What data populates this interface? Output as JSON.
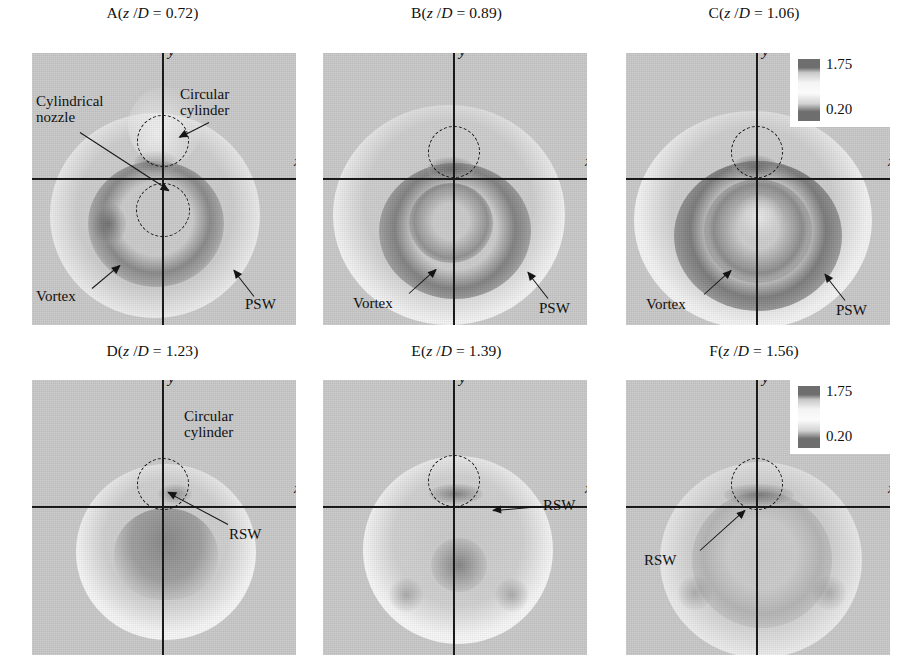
{
  "figure": {
    "kind": "shadowgraph-flow-visualization-grid",
    "rows": 2,
    "cols": 3,
    "background_color": "#ffffff",
    "field_background_color": "#c9c9c9"
  },
  "colorbar": {
    "max_label": "1.75",
    "min_label": "0.20",
    "dark_color": "#6e6e6e",
    "light_color": "#fbfbfb"
  },
  "axes": {
    "x_label": "x",
    "y_label": "y",
    "axis_color": "#1a1a1a"
  },
  "panels": [
    {
      "id": "A",
      "title": "A(z /D = 0.72)",
      "title_letter": "A",
      "title_var_z": "z",
      "title_var_D": "D",
      "title_value": "0.72",
      "has_colorbar": false,
      "annotations": [
        {
          "name": "cylindrical-nozzle",
          "label": "Cylindrical\nnozzle"
        },
        {
          "name": "circular-cylinder",
          "label": "Circular\ncylinder"
        },
        {
          "name": "vortex",
          "label": "Vortex"
        },
        {
          "name": "psw",
          "label": "PSW"
        }
      ],
      "dashed_circles": [
        "circular-cylinder-marker",
        "cylindrical-nozzle-marker"
      ]
    },
    {
      "id": "B",
      "title": "B(z /D = 0.89)",
      "title_letter": "B",
      "title_var_z": "z",
      "title_var_D": "D",
      "title_value": "0.89",
      "has_colorbar": false,
      "annotations": [
        {
          "name": "vortex",
          "label": "Vortex"
        },
        {
          "name": "psw",
          "label": "PSW"
        }
      ],
      "dashed_circles": [
        "circular-cylinder-marker"
      ]
    },
    {
      "id": "C",
      "title": "C(z /D = 1.06)",
      "title_letter": "C",
      "title_var_z": "z",
      "title_var_D": "D",
      "title_value": "1.06",
      "has_colorbar": true,
      "annotations": [
        {
          "name": "vortex",
          "label": "Vortex"
        },
        {
          "name": "psw",
          "label": "PSW"
        }
      ],
      "dashed_circles": [
        "circular-cylinder-marker"
      ]
    },
    {
      "id": "D",
      "title": "D(z /D = 1.23)",
      "title_letter": "D",
      "title_var_z": "z",
      "title_var_D": "D",
      "title_value": "1.23",
      "has_colorbar": false,
      "annotations": [
        {
          "name": "circular-cylinder",
          "label": "Circular\ncylinder"
        },
        {
          "name": "rsw",
          "label": "RSW"
        }
      ],
      "dashed_circles": [
        "circular-cylinder-marker"
      ]
    },
    {
      "id": "E",
      "title": "E(z /D = 1.39)",
      "title_letter": "E",
      "title_var_z": "z",
      "title_var_D": "D",
      "title_value": "1.39",
      "has_colorbar": false,
      "annotations": [
        {
          "name": "rsw",
          "label": "RSW"
        }
      ],
      "dashed_circles": [
        "circular-cylinder-marker"
      ]
    },
    {
      "id": "F",
      "title": "F(z /D = 1.56)",
      "title_letter": "F",
      "title_var_z": "z",
      "title_var_D": "D",
      "title_value": "1.56",
      "has_colorbar": true,
      "annotations": [
        {
          "name": "rsw",
          "label": "RSW"
        }
      ],
      "dashed_circles": [
        "circular-cylinder-marker"
      ]
    }
  ],
  "labels": {
    "cylindrical_nozzle": "Cylindrical\nnozzle",
    "circular_cylinder": "Circular\ncylinder",
    "vortex": "Vortex",
    "psw": "PSW",
    "rsw": "RSW"
  }
}
